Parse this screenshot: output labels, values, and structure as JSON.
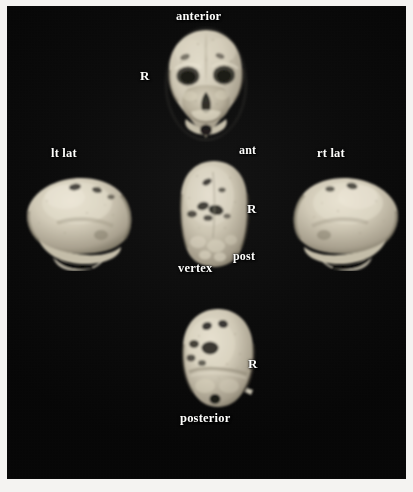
{
  "figure": {
    "type": "3d-ct-reconstruction-panel",
    "background_color": "#070707",
    "label_color": "#fdfdfb",
    "bone_color": "#cdc6b4",
    "plate_border_color": "#f4f3f1",
    "view_count": 6
  },
  "labels": {
    "anterior": "anterior",
    "posterior": "posterior",
    "vertex": "vertex",
    "lt_lat": "lt lat",
    "rt_lat": "rt lat",
    "ant": "ant",
    "post": "post",
    "r_top": "R",
    "r_center": "R",
    "r_bottom": "R"
  },
  "views": [
    {
      "id": "anterior-view",
      "label": "anterior",
      "side_marker": "R",
      "position": "top-center",
      "description": "frontal view of skull showing orbits, nasal aperture and maxilla"
    },
    {
      "id": "left-lateral-view",
      "label": "lt lat",
      "side_marker": "",
      "position": "middle-left",
      "description": "left lateral profile of calvarium with mandible below"
    },
    {
      "id": "vertex-view",
      "label": "vertex",
      "side_marker": "R",
      "position": "middle-center",
      "description": "superior vertex view with anterior at top and posterior at bottom",
      "orientation_marks": [
        "ant",
        "post"
      ]
    },
    {
      "id": "right-lateral-view",
      "label": "rt lat",
      "side_marker": "",
      "position": "middle-right",
      "description": "right lateral profile of calvarium with mandible below"
    },
    {
      "id": "posterior-view",
      "label": "posterior",
      "side_marker": "R",
      "position": "bottom-center",
      "description": "occipital view of skull with lambdoid defects and foramen magnum"
    }
  ]
}
